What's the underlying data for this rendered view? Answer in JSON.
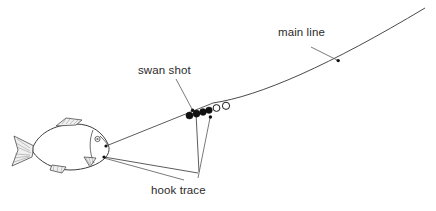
{
  "diagram": {
    "background_color": "#ffffff",
    "line_color": "#4a4a4a",
    "shot_fill_color": "#111111",
    "bead_fill_color": "#ffffff",
    "text_color": "#2b2b2b",
    "width": 436,
    "height": 211
  },
  "labels": {
    "main_line": "main line",
    "swan_shot": "swan shot",
    "hook_trace": "hook trace"
  },
  "components": {
    "fish": {
      "name": "fish",
      "facing": "right"
    },
    "shots": {
      "filled_count": 4,
      "open_count": 2
    }
  }
}
